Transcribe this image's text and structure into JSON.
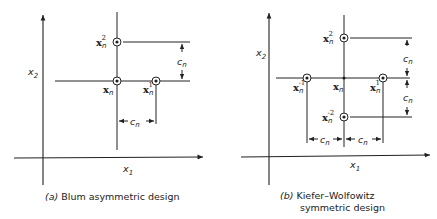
{
  "panels": [
    {
      "id": "a",
      "caption_letter": "(a)",
      "caption": "Blum asymmetric design",
      "axes": {
        "x": "x",
        "x_sub": "1",
        "y": "x",
        "y_sub": "2"
      },
      "points": [
        {
          "name": "x",
          "sub": "n",
          "sup": "2"
        },
        {
          "name": "x",
          "sub": "n",
          "sup": ""
        },
        {
          "name": "x",
          "sub": "n",
          "sup": "1"
        }
      ],
      "dimensions": [
        {
          "label": "c",
          "sub": "n"
        },
        {
          "label": "c",
          "sub": "n"
        }
      ]
    },
    {
      "id": "b",
      "caption_letter": "(b)",
      "caption_line1": "Kiefer–Wolfowitz",
      "caption_line2": "symmetric design",
      "axes": {
        "x": "x",
        "x_sub": "1",
        "y": "x",
        "y_sub": "2"
      },
      "points": [
        {
          "name": "x",
          "sub": "n",
          "sup": "2"
        },
        {
          "name": "x",
          "sub": "n",
          "sup": "-1"
        },
        {
          "name": "x",
          "sub": "n",
          "sup": ""
        },
        {
          "name": "x",
          "sub": "n",
          "sup": "1"
        },
        {
          "name": "x",
          "sub": "n",
          "sup": "-2"
        }
      ],
      "dimensions": [
        {
          "label": "c",
          "sub": "n"
        },
        {
          "label": "c",
          "sub": "n"
        },
        {
          "label": "c",
          "sub": "n"
        },
        {
          "label": "c",
          "sub": "n"
        }
      ]
    }
  ]
}
